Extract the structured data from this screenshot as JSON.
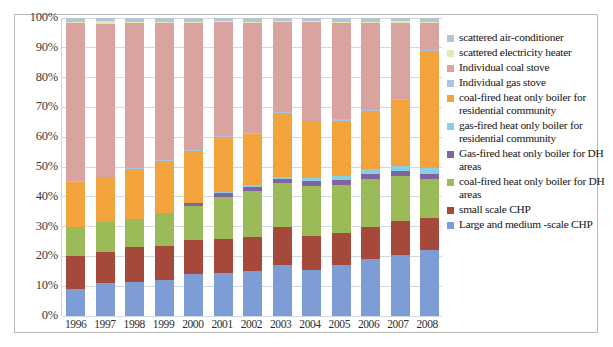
{
  "chart_data": {
    "type": "bar",
    "stacked": true,
    "stack_mode": "percent",
    "title": "",
    "xlabel": "",
    "ylabel": "",
    "ylim": [
      0,
      100
    ],
    "ytick_labels": [
      "0%",
      "10%",
      "20%",
      "30%",
      "40%",
      "50%",
      "60%",
      "70%",
      "80%",
      "90%",
      "100%"
    ],
    "ytick_values": [
      0,
      10,
      20,
      30,
      40,
      50,
      60,
      70,
      80,
      90,
      100
    ],
    "grid": true,
    "legend_position": "right",
    "categories": [
      "1996",
      "1997",
      "1998",
      "1999",
      "2000",
      "2001",
      "2002",
      "2003",
      "2004",
      "2005",
      "2006",
      "2007",
      "2008"
    ],
    "series": [
      {
        "name": "Large and medium -scale CHP",
        "color": "#7d9dd4",
        "values": [
          9,
          11,
          11.5,
          12,
          14,
          14.5,
          15,
          17,
          15.5,
          17,
          19,
          20.5,
          22
        ]
      },
      {
        "name": "small scale CHP",
        "color": "#a5493b",
        "values": [
          11,
          10.5,
          11.5,
          11.5,
          11.5,
          11.5,
          11.5,
          13,
          11.5,
          11,
          11,
          11.5,
          11
        ]
      },
      {
        "name": "coal-fired heat only boiler for DH areas",
        "color": "#9bbb59",
        "values": [
          10,
          10,
          9.5,
          11,
          11.5,
          14,
          15.5,
          14.5,
          16.5,
          16,
          16,
          15,
          13
        ]
      },
      {
        "name": "Gas-fired heat only boiler for DH areas",
        "color": "#8064a2",
        "values": [
          0,
          0,
          0,
          0,
          1,
          1.2,
          1.3,
          1.5,
          1.8,
          1.8,
          1.8,
          1.8,
          1.8
        ]
      },
      {
        "name": "gas-fired heat only boiler for residential community",
        "color": "#87cfe3",
        "values": [
          0,
          0,
          0,
          0,
          0,
          0.5,
          0.7,
          0.8,
          1,
          1.2,
          1.5,
          1.7,
          2
        ]
      },
      {
        "name": "coal-fired heat only boiler for residential community",
        "color": "#f2a33c",
        "values": [
          15,
          15,
          17,
          17.5,
          17.5,
          18.5,
          17,
          21.5,
          19,
          18.5,
          19.5,
          22,
          39
        ]
      },
      {
        "name": "Individual gas stove",
        "color": "#a9c4e0",
        "values": [
          0.3,
          0.3,
          0.3,
          0.3,
          0.3,
          0.3,
          0.3,
          0.3,
          0.3,
          0.5,
          0.5,
          0.5,
          0.5
        ]
      },
      {
        "name": "Individual coal stove",
        "color": "#d9a3a0",
        "values": [
          53.2,
          51.2,
          48.7,
          46.2,
          42.7,
          38.2,
          37.2,
          30.0,
          33.1,
          32.3,
          29.0,
          25.3,
          9.0
        ]
      },
      {
        "name": "scattered electricity heater",
        "color": "#e5e8b0",
        "values": [
          0.3,
          1.0,
          0.3,
          0.3,
          0.3,
          0.3,
          0.3,
          0.3,
          0.3,
          0.5,
          0.5,
          0.7,
          0.5
        ]
      },
      {
        "name": "scattered air-conditioner",
        "color": "#b6c4d8",
        "values": [
          1.2,
          1.0,
          1.2,
          1.2,
          1.2,
          1.0,
          1.2,
          1.1,
          1.0,
          1.2,
          1.2,
          1.0,
          1.2
        ]
      }
    ]
  },
  "legend": {
    "items": [
      {
        "label": "scattered air-conditioner",
        "color": "#b6c4d8"
      },
      {
        "label": "scattered electricity heater",
        "color": "#e5e8b0"
      },
      {
        "label": "Individual coal stove",
        "color": "#d9a3a0"
      },
      {
        "label": "Individual gas stove",
        "color": "#a9c4e0"
      },
      {
        "label": "coal-fired heat only boiler for residential community",
        "color": "#f2a33c"
      },
      {
        "label": "gas-fired heat only boiler for residential community",
        "color": "#87cfe3"
      },
      {
        "label": "Gas-fired heat only boiler for DH areas",
        "color": "#8064a2"
      },
      {
        "label": "coal-fired heat only boiler for DH areas",
        "color": "#9bbb59"
      },
      {
        "label": "small scale CHP",
        "color": "#a5493b"
      },
      {
        "label": "Large and medium -scale CHP",
        "color": "#7d9dd4"
      }
    ]
  }
}
